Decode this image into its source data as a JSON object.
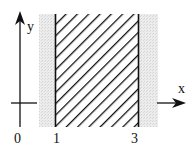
{
  "diagram": {
    "axes": {
      "x_label": "x",
      "y_label": "y",
      "origin_label": "0"
    },
    "region": {
      "x_min": 1,
      "x_max": 3,
      "x_min_label": "1",
      "x_max_label": "3",
      "fill_pattern": "diagonal-hatch",
      "boundary_style": "solid"
    },
    "colors": {
      "ink": "#111111",
      "background_band": "#e6e6e6"
    }
  }
}
